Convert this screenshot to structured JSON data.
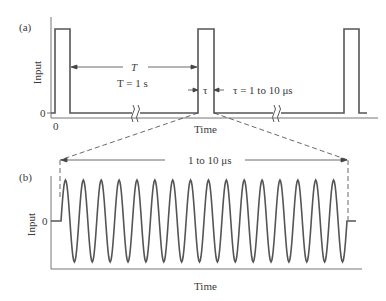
{
  "panel_a": {
    "label": "(a)",
    "ylabel": "Input",
    "yzero": "0",
    "xzero": "0",
    "xlabel": "Time",
    "period_symbol": "T",
    "period_value": "T = 1 s",
    "width_symbol": "τ",
    "width_value": "τ = 1 to 10 μs"
  },
  "panel_b": {
    "label": "(b)",
    "ylabel": "Input",
    "yzero": "0",
    "xlabel": "Time",
    "span_label": "1 to 10 μs",
    "cycles": 16
  },
  "colors": {
    "line": "#555555",
    "text": "#3a3a3a"
  }
}
